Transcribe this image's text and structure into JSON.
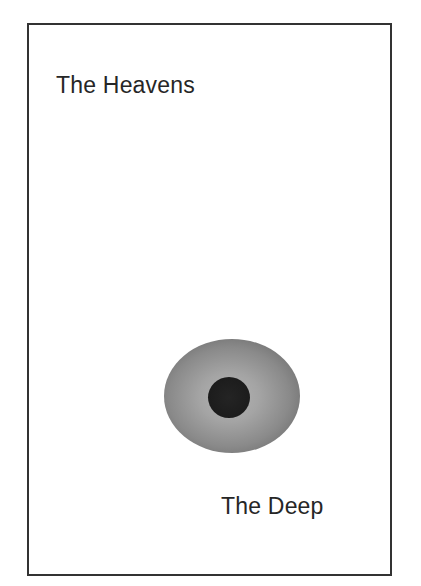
{
  "figure": {
    "labels": {
      "top": "The Heavens",
      "bottom": "The Deep"
    },
    "shapes": {
      "outer_ellipse": {
        "description": "gray radial-gradient ellipse",
        "center_color": "#b4b4b4",
        "edge_color": "#5c5c5c"
      },
      "inner_disc": {
        "description": "dark central disc",
        "color": "#1c1c1c"
      }
    },
    "frame_color": "#333333"
  }
}
